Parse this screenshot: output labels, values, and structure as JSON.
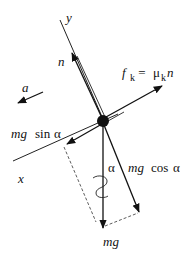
{
  "diagram": {
    "type": "free-body diagram",
    "object": "block on incline (point mass)",
    "axes": {
      "x_label": "x",
      "y_label": "y"
    },
    "forces": {
      "normal": {
        "label": "n"
      },
      "friction": {
        "label_f": "f",
        "label_f_sub": "k",
        "label_eq": " = ",
        "label_mu": "μ",
        "label_mu_sub": "k",
        "label_n": "n"
      },
      "weight": {
        "label": "mg"
      },
      "weight_parallel": {
        "label_mg": "mg",
        "label_fn": "sin",
        "label_angle": "α"
      },
      "weight_perpendicular": {
        "label_mg": "mg",
        "label_fn": "cos",
        "label_angle": "α"
      }
    },
    "acceleration": {
      "label": "a"
    },
    "angle": {
      "label": "α"
    },
    "colors": {
      "stroke": "#111111",
      "background": "#ffffff"
    }
  }
}
